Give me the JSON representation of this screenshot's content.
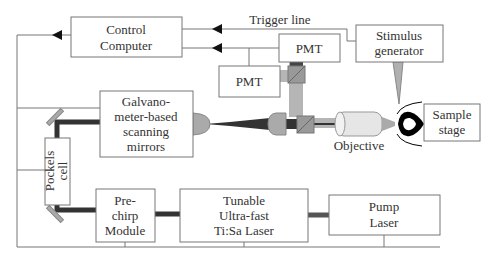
{
  "diagram": {
    "boxes": {
      "control_computer": [
        "Control",
        "Computer"
      ],
      "pmt_top": [
        "PMT"
      ],
      "pmt_left": [
        "PMT"
      ],
      "stimulus_generator": [
        "Stimulus",
        "generator"
      ],
      "galvo": [
        "Galvano-",
        "meter-based",
        "scanning",
        "mirrors"
      ],
      "sample_stage": [
        "Sample",
        "stage"
      ],
      "pockels_cell": [
        "Pockels",
        "cell"
      ],
      "prechirp": [
        "Pre-",
        "chirp",
        "Module"
      ],
      "tunable_laser": [
        "Tunable",
        "Ultra-fast",
        "Ti:Sa Laser"
      ],
      "pump_laser": [
        "Pump",
        "Laser"
      ]
    },
    "labels": {
      "trigger_line": "Trigger line",
      "objective": "Objective"
    },
    "colors": {
      "box_stroke": "#777777",
      "beam_dark": "#333333",
      "beam_light": "#b0b0b0",
      "optic_gray": "#a8a8a8",
      "text": "#333333"
    }
  }
}
